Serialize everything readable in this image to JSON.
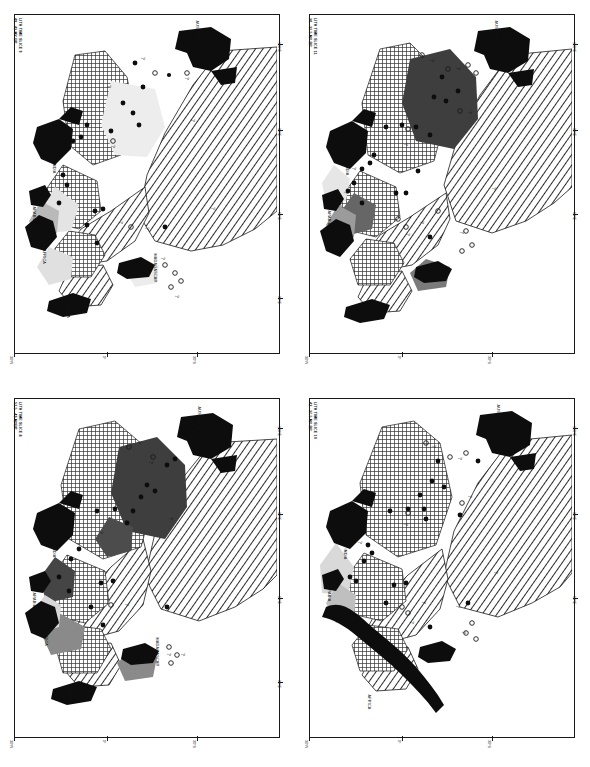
{
  "figure": {
    "orientation": "maps rotated 90 degrees on page",
    "panel_count": 4
  },
  "panels": [
    {
      "id": "top-left",
      "title_line1": "LITH TIME SLICE 9",
      "title_line2": "49 - 43 MY BP",
      "slice_number": "9",
      "age_range": "49 - 43 MY BP",
      "continents": [
        "INDIA",
        "AUSTRALIA",
        "MADAGASCAR",
        "S. AFRICA",
        "E. AFRICA",
        "ARABIA"
      ],
      "lat_ticks": [
        "30°N",
        "0°",
        "30°S"
      ],
      "lon_ticks": [
        "30°E",
        "60°E",
        "90°E",
        "120°E"
      ]
    },
    {
      "id": "top-right",
      "title_line1": "LITH TIME SLICE 11",
      "title_line2": "30 - 32.5 MY BP",
      "slice_number": "11",
      "age_range": "30 - 32.5 MY BP",
      "continents": [
        "INDIA",
        "AUSTRALIA",
        "AFRICA",
        "ARABIA"
      ],
      "lat_ticks": [
        "30°N",
        "0°",
        "30°S"
      ],
      "lon_ticks": [
        "30°E",
        "60°E",
        "90°E",
        "120°E"
      ]
    },
    {
      "id": "bottom-left",
      "title_line1": "LITH TIME SLICE 8",
      "title_line2": "52.5 - 49 MYBP",
      "slice_number": "8",
      "age_range": "52.5 - 49 MYBP",
      "continents": [
        "INDIA",
        "AUSTRALIA",
        "MADAGASCAR",
        "S. AFRICA",
        "E. AFRICA",
        "ARABIA"
      ],
      "lat_ticks": [
        "30°N",
        "0°",
        "30°S"
      ],
      "lon_ticks": [
        "30°E",
        "60°E",
        "90°E",
        "120°E"
      ]
    },
    {
      "id": "bottom-right",
      "title_line1": "LITH TIME SLICE 10",
      "title_line2": "43 - 37.5 MY BP",
      "slice_number": "10",
      "age_range": "43 - 37.5 MY BP",
      "continents": [
        "INDIA",
        "AUSTRALIA",
        "AFRICA",
        "ARABIA"
      ],
      "lat_ticks": [
        "30°N",
        "0°",
        "30°S"
      ],
      "lon_ticks": [
        "30°E",
        "60°E",
        "90°E",
        "120°E"
      ]
    }
  ],
  "symbols": {
    "query": "?",
    "filled_circle": "filled data point",
    "open_circle": "open data point"
  },
  "colors": {
    "landmass": "#0d0d0d",
    "dark_facies": "#3b3b3b",
    "mid_facies": "#6e6e6e",
    "light_facies": "#d9d9d9",
    "outline": "#1a1a1a",
    "background": "#ffffff"
  }
}
